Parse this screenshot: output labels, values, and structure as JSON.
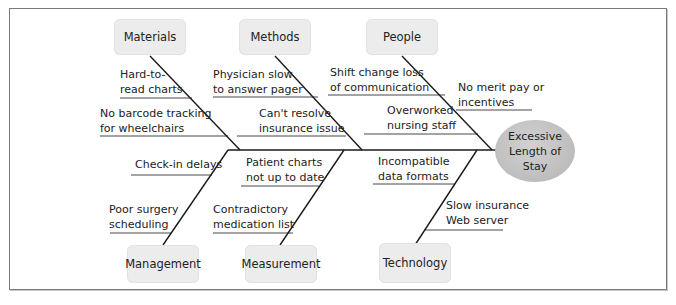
{
  "diagram": {
    "type": "fishbone",
    "effect": {
      "line1": "Excessive",
      "line2": "Length of",
      "line3": "Stay"
    },
    "categories": {
      "materials": {
        "label": "Materials",
        "causes": [
          {
            "line1": "Hard-to-",
            "line2": "read charts"
          },
          {
            "line1": "No barcode tracking",
            "line2": "for wheelchairs"
          }
        ]
      },
      "methods": {
        "label": "Methods",
        "causes": [
          {
            "line1": "Physician slow",
            "line2": "to answer pager"
          },
          {
            "line1": "Can't resolve",
            "line2": "insurance issue"
          }
        ]
      },
      "people": {
        "label": "People",
        "causes": [
          {
            "line1": "Shift change loss",
            "line2": "of communication"
          },
          {
            "line1": "No merit pay or",
            "line2": "incentives"
          },
          {
            "line1": "Overworked",
            "line2": "nursing staff"
          }
        ]
      },
      "management": {
        "label": "Management",
        "causes": [
          {
            "line1": "Check-in delays"
          },
          {
            "line1": "Poor surgery",
            "line2": "scheduling"
          }
        ]
      },
      "measurement": {
        "label": "Measurement",
        "causes": [
          {
            "line1": "Patient charts",
            "line2": "not up to date"
          },
          {
            "line1": "Contradictory",
            "line2": "medication list"
          }
        ]
      },
      "technology": {
        "label": "Technology",
        "causes": [
          {
            "line1": "Incompatible",
            "line2": "data formats"
          },
          {
            "line1": "Slow insurance",
            "line2": "Web server"
          }
        ]
      }
    }
  }
}
